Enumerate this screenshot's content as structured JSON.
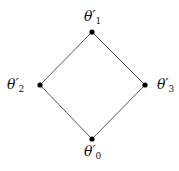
{
  "diagram": {
    "type": "hasse-diagram",
    "nodes": [
      {
        "id": "n1",
        "label": "θ′",
        "subscript": "1",
        "x": 92,
        "y": 32
      },
      {
        "id": "n2",
        "label": "θ′",
        "subscript": "2",
        "x": 40,
        "y": 85
      },
      {
        "id": "n3",
        "label": "θ′",
        "subscript": "3",
        "x": 145,
        "y": 85
      },
      {
        "id": "n0",
        "label": "θ′",
        "subscript": "0",
        "x": 92,
        "y": 139
      }
    ],
    "edges": [
      {
        "from": "n1",
        "to": "n2"
      },
      {
        "from": "n1",
        "to": "n3"
      },
      {
        "from": "n2",
        "to": "n0"
      },
      {
        "from": "n3",
        "to": "n0"
      }
    ],
    "colors": {
      "line": "#444444",
      "node": "#000000",
      "text": "#111111"
    }
  }
}
